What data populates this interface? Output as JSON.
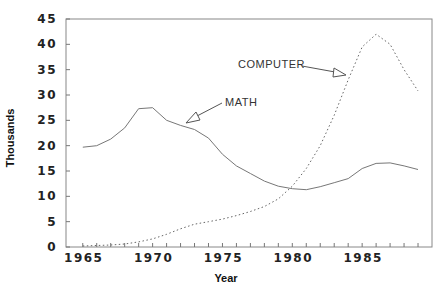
{
  "chart_data": {
    "type": "line",
    "title": "",
    "xlabel": "Year",
    "ylabel": "Thousands",
    "xlim": [
      1963.7,
      1990
    ],
    "ylim": [
      0,
      45
    ],
    "x_ticks": [
      1965,
      1970,
      1975,
      1980,
      1985
    ],
    "y_ticks": [
      0,
      5,
      10,
      15,
      20,
      25,
      30,
      35,
      40,
      45
    ],
    "grid": false,
    "legend": "none (inline annotations with arrows)",
    "x": [
      1965,
      1966,
      1967,
      1968,
      1969,
      1970,
      1971,
      1972,
      1973,
      1974,
      1975,
      1976,
      1977,
      1978,
      1979,
      1980,
      1981,
      1982,
      1983,
      1984,
      1985,
      1986,
      1987,
      1988,
      1989
    ],
    "series": [
      {
        "name": "MATH",
        "style": "solid",
        "values": [
          19.7,
          20.0,
          21.3,
          23.5,
          27.3,
          27.5,
          25.0,
          24.0,
          23.2,
          21.5,
          18.3,
          16.0,
          14.5,
          13.0,
          12.0,
          11.5,
          11.3,
          11.9,
          12.7,
          13.5,
          15.5,
          16.5,
          16.6,
          16.0,
          15.3
        ]
      },
      {
        "name": "COMPUTER",
        "style": "dotted",
        "values": [
          0.2,
          0.3,
          0.4,
          0.6,
          1.0,
          1.6,
          2.5,
          3.6,
          4.5,
          5.0,
          5.5,
          6.2,
          7.0,
          8.0,
          9.5,
          12.0,
          15.5,
          20.0,
          26.0,
          33.0,
          39.5,
          42.0,
          40.0,
          35.0,
          30.8
        ]
      }
    ],
    "annotations": [
      {
        "text": "MATH",
        "target_series": "MATH"
      },
      {
        "text": "COMPUTER",
        "target_series": "COMPUTER"
      }
    ]
  }
}
